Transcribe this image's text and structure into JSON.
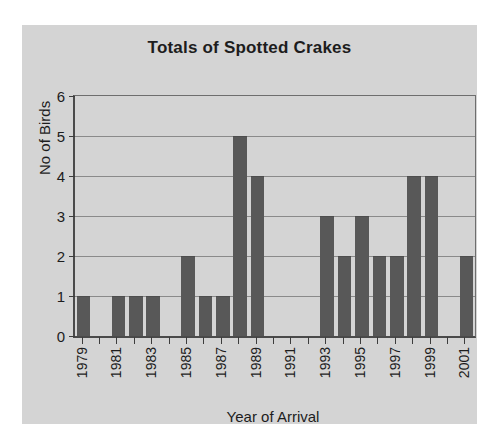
{
  "chart_data": {
    "type": "bar",
    "title": "Totals of Spotted Crakes",
    "xlabel": "Year of Arrival",
    "ylabel": "No of Birds",
    "ylim": [
      0,
      6
    ],
    "ytick_labels": [
      "6",
      "5",
      "4",
      "3",
      "2",
      "1",
      "0"
    ],
    "ytick_values": [
      6,
      5,
      4,
      3,
      2,
      1,
      0
    ],
    "grid": "horizontal",
    "legend": "none",
    "bar_color": "#585858",
    "plot_background": "#d4d4d4",
    "categories": [
      "1979",
      "1980",
      "1981",
      "1982",
      "1983",
      "1984",
      "1985",
      "1986",
      "1987",
      "1988",
      "1989",
      "1990",
      "1991",
      "1992",
      "1993",
      "1994",
      "1995",
      "1996",
      "1997",
      "1998",
      "1999",
      "2000",
      "2001"
    ],
    "values": [
      1,
      0,
      1,
      1,
      1,
      0,
      2,
      1,
      1,
      5,
      4,
      0,
      0,
      0,
      3,
      2,
      3,
      2,
      2,
      4,
      4,
      0,
      2
    ],
    "visible_xtick_labels": [
      "1979",
      "",
      "1981",
      "",
      "1983",
      "",
      "1985",
      "",
      "1987",
      "",
      "1989",
      "",
      "1991",
      "",
      "1993",
      "",
      "1995",
      "",
      "1997",
      "",
      "1999",
      "",
      "2001"
    ]
  }
}
